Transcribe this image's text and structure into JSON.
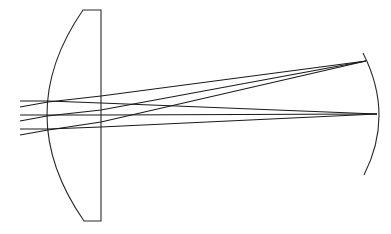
{
  "diagram": {
    "type": "optical-ray-trace",
    "colors": {
      "background": "#ffffff",
      "stroke": "#1a1a1a"
    },
    "lens": {
      "shape": "plano-convex",
      "flat_face_x": 101,
      "top_y": 10,
      "bottom_y": 221,
      "curved_apex": [
        47,
        115
      ],
      "top_corner": [
        83,
        10
      ],
      "bottom_corner": [
        84,
        221
      ]
    },
    "mirror": {
      "shape": "concave-arc",
      "top": [
        363,
        53
      ],
      "apex": [
        379,
        115
      ],
      "bottom": [
        364,
        175
      ]
    },
    "ray_bundles": [
      {
        "name": "on-axis",
        "focus": [
          377,
          114
        ],
        "rays": [
          {
            "start": [
              20,
              101
            ],
            "lens_in": [
              48,
              101
            ],
            "lens_out": [
              101,
              103
            ]
          },
          {
            "start": [
              20,
              115
            ],
            "lens_in": [
              47,
              115
            ],
            "lens_out": [
              101,
              115
            ]
          },
          {
            "start": [
              20,
              129
            ],
            "lens_in": [
              48,
              129
            ],
            "lens_out": [
              101,
              127
            ]
          }
        ]
      },
      {
        "name": "off-axis",
        "focus": [
          366,
          61
        ],
        "rays": [
          {
            "start": [
              20,
              107
            ],
            "lens_in": [
              48,
              102
            ],
            "lens_out": [
              101,
              96
            ]
          },
          {
            "start": [
              20,
              121
            ],
            "lens_in": [
              47,
              116
            ],
            "lens_out": [
              101,
              110
            ]
          },
          {
            "start": [
              20,
              135
            ],
            "lens_in": [
              48,
              130
            ],
            "lens_out": [
              101,
              122
            ]
          }
        ]
      }
    ]
  }
}
